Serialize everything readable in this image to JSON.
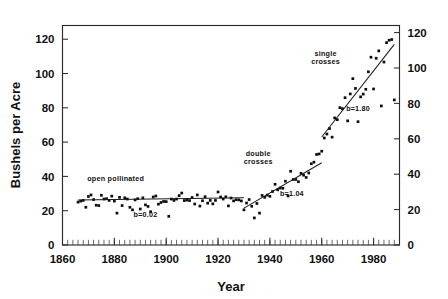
{
  "chart_data": {
    "type": "scatter",
    "title": "",
    "subtitle": "",
    "xlabel": "Year",
    "ylabel": "Bushels per Acre",
    "ylabel_right": "",
    "xlim": [
      1860,
      1990
    ],
    "ylim": [
      0,
      128
    ],
    "ylim_right": [
      0,
      124
    ],
    "grid": false,
    "legend_position": "none",
    "x_ticks": [
      1860,
      1880,
      1900,
      1920,
      1940,
      1960,
      1980
    ],
    "x_tick_labels": [
      "1860",
      "1880",
      "1900",
      "1920",
      "1940",
      "1960",
      "1980"
    ],
    "x_minor_tick_interval": 2,
    "y_ticks_left": [
      0,
      20,
      40,
      60,
      80,
      100,
      120
    ],
    "y_tick_labels_left": [
      "0",
      "20",
      "40",
      "60",
      "80",
      "100",
      "120"
    ],
    "y_ticks_right": [
      0,
      20,
      40,
      60,
      80,
      100,
      120
    ],
    "y_tick_labels_right": [
      "0",
      "20",
      "40",
      "60",
      "80",
      "100",
      "120"
    ],
    "annotations": [
      {
        "id": "open-pollinated",
        "text": "open pollinated",
        "x": 1880.5,
        "y": 37.5
      },
      {
        "id": "slope-open-pollinated",
        "text": "b=0.02",
        "x": 1892.0,
        "y": 16.5
      },
      {
        "id": "double-crosses",
        "text": "double crosses",
        "line1": "double",
        "line2": "crosses",
        "x": 1935.5,
        "y": 52.0
      },
      {
        "id": "slope-double-crosses",
        "text": "b=1.04",
        "x": 1948.5,
        "y": 28.5
      },
      {
        "id": "single-crosses",
        "text": "single crosses",
        "line1": "single",
        "line2": "crosses",
        "x": 1961.5,
        "y": 110.5
      },
      {
        "id": "slope-single-crosses",
        "text": "b=1.80",
        "x": 1974.0,
        "y": 78.0
      }
    ],
    "series": [
      {
        "name": "open pollinated era",
        "marker": "square-dot",
        "trendline": {
          "label": "b=0.02",
          "slope": 0.02,
          "x_start": 1866,
          "x_end": 1930,
          "y_start": 26.2,
          "y_end": 27.5
        },
        "points": [
          [
            1866,
            25.0
          ],
          [
            1867,
            25.6
          ],
          [
            1868,
            26.0
          ],
          [
            1869,
            22.0
          ],
          [
            1870,
            28.3
          ],
          [
            1871,
            29.2
          ],
          [
            1872,
            26.5
          ],
          [
            1873,
            23.2
          ],
          [
            1874,
            23.0
          ],
          [
            1875,
            29.0
          ],
          [
            1876,
            26.8
          ],
          [
            1877,
            27.0
          ],
          [
            1878,
            26.0
          ],
          [
            1879,
            28.5
          ],
          [
            1880,
            25.6
          ],
          [
            1881,
            18.6
          ],
          [
            1882,
            27.8
          ],
          [
            1883,
            23.0
          ],
          [
            1884,
            27.5
          ],
          [
            1885,
            26.8
          ],
          [
            1886,
            22.0
          ],
          [
            1887,
            20.5
          ],
          [
            1888,
            26.3
          ],
          [
            1889,
            27.0
          ],
          [
            1890,
            21.0
          ],
          [
            1891,
            27.5
          ],
          [
            1892,
            23.4
          ],
          [
            1893,
            22.5
          ],
          [
            1894,
            19.4
          ],
          [
            1895,
            28.0
          ],
          [
            1896,
            28.6
          ],
          [
            1897,
            23.8
          ],
          [
            1898,
            24.8
          ],
          [
            1899,
            25.4
          ],
          [
            1900,
            25.3
          ],
          [
            1901,
            16.7
          ],
          [
            1902,
            26.8
          ],
          [
            1903,
            26.0
          ],
          [
            1904,
            26.8
          ],
          [
            1905,
            28.8
          ],
          [
            1906,
            30.3
          ],
          [
            1907,
            25.9
          ],
          [
            1908,
            26.2
          ],
          [
            1909,
            25.9
          ],
          [
            1910,
            27.7
          ],
          [
            1911,
            23.9
          ],
          [
            1912,
            29.2
          ],
          [
            1913,
            22.7
          ],
          [
            1914,
            25.8
          ],
          [
            1915,
            28.2
          ],
          [
            1916,
            24.4
          ],
          [
            1917,
            26.0
          ],
          [
            1918,
            24.0
          ],
          [
            1919,
            26.0
          ],
          [
            1920,
            30.9
          ],
          [
            1921,
            28.0
          ],
          [
            1922,
            26.8
          ],
          [
            1923,
            28.1
          ],
          [
            1924,
            22.8
          ],
          [
            1925,
            27.4
          ],
          [
            1926,
            25.7
          ],
          [
            1927,
            26.4
          ],
          [
            1928,
            26.3
          ],
          [
            1929,
            25.7
          ],
          [
            1930,
            20.5
          ]
        ]
      },
      {
        "name": "double crosses era",
        "marker": "square-dot",
        "trendline": {
          "label": "b=1.04",
          "slope": 1.04,
          "x_start": 1930,
          "x_end": 1960,
          "y_start": 21.5,
          "y_end": 48.0
        },
        "points": [
          [
            1931,
            24.5
          ],
          [
            1932,
            26.5
          ],
          [
            1933,
            22.6
          ],
          [
            1934,
            15.8
          ],
          [
            1935,
            24.2
          ],
          [
            1936,
            18.6
          ],
          [
            1937,
            28.9
          ],
          [
            1938,
            27.8
          ],
          [
            1939,
            29.1
          ],
          [
            1940,
            28.4
          ],
          [
            1941,
            31.2
          ],
          [
            1942,
            35.4
          ],
          [
            1943,
            32.2
          ],
          [
            1944,
            33.2
          ],
          [
            1945,
            33.1
          ],
          [
            1946,
            37.2
          ],
          [
            1947,
            28.6
          ],
          [
            1948,
            43.0
          ],
          [
            1949,
            38.2
          ],
          [
            1950,
            38.2
          ],
          [
            1951,
            36.9
          ],
          [
            1952,
            41.8
          ],
          [
            1953,
            40.7
          ],
          [
            1954,
            39.4
          ],
          [
            1955,
            42.0
          ],
          [
            1956,
            47.4
          ],
          [
            1957,
            48.3
          ],
          [
            1958,
            52.8
          ],
          [
            1959,
            53.1
          ],
          [
            1960,
            54.7
          ]
        ]
      },
      {
        "name": "single crosses era",
        "marker": "square-dot",
        "trendline": {
          "label": "b=1.80",
          "slope": 1.8,
          "x_start": 1960,
          "x_end": 1988,
          "y_start": 63.0,
          "y_end": 117.0
        },
        "points": [
          [
            1961,
            62.4
          ],
          [
            1962,
            64.7
          ],
          [
            1963,
            67.9
          ],
          [
            1964,
            62.9
          ],
          [
            1965,
            74.1
          ],
          [
            1966,
            73.1
          ],
          [
            1967,
            80.1
          ],
          [
            1968,
            79.5
          ],
          [
            1969,
            85.9
          ],
          [
            1970,
            72.4
          ],
          [
            1971,
            88.1
          ],
          [
            1972,
            97.0
          ],
          [
            1973,
            91.3
          ],
          [
            1974,
            71.9
          ],
          [
            1975,
            86.4
          ],
          [
            1976,
            88.0
          ],
          [
            1977,
            90.8
          ],
          [
            1978,
            101.0
          ],
          [
            1979,
            109.5
          ],
          [
            1980,
            91.0
          ],
          [
            1981,
            108.9
          ],
          [
            1982,
            113.2
          ],
          [
            1983,
            81.1
          ],
          [
            1984,
            106.7
          ],
          [
            1985,
            118.0
          ],
          [
            1986,
            119.4
          ],
          [
            1987,
            119.8
          ],
          [
            1988,
            84.6
          ]
        ]
      }
    ]
  },
  "figure": {
    "y_axis_label": "Bushels per Acre",
    "x_axis_label": "Year"
  }
}
